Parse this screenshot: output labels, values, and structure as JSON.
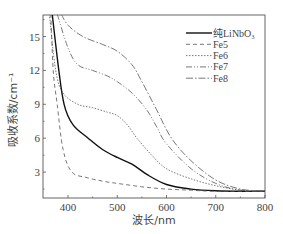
{
  "chart_data": {
    "type": "line",
    "title": "",
    "xlabel": "波长/nm",
    "ylabel": "吸收系数/cm⁻¹",
    "xlim": [
      350,
      805
    ],
    "ylim": [
      0.7,
      17
    ],
    "xticks": [
      400,
      500,
      600,
      700,
      800
    ],
    "yticks": [
      3,
      6,
      9,
      12,
      15
    ],
    "grid": false,
    "legend_position": "upper right",
    "series": [
      {
        "name": "纯LiNbO₃",
        "style": "solid",
        "x": [
          368,
          380,
          392,
          410,
          441,
          470,
          500,
          530,
          560,
          600,
          650,
          700,
          750,
          800
        ],
        "y": [
          17,
          12.5,
          9,
          7.2,
          6,
          5,
          4.3,
          3.7,
          2.8,
          1.9,
          1.5,
          1.35,
          1.3,
          1.3
        ]
      },
      {
        "name": "Fe5",
        "style": "dashed",
        "x": [
          365,
          370,
          378,
          390,
          408,
          440,
          470,
          500,
          550,
          600,
          650,
          700,
          800
        ],
        "y": [
          17,
          12,
          9,
          5,
          3,
          2.5,
          2.2,
          2.0,
          1.7,
          1.5,
          1.4,
          1.3,
          1.3
        ]
      },
      {
        "name": "Fe6",
        "style": "dotted",
        "x": [
          362,
          375,
          390,
          420,
          450,
          480,
          500,
          520,
          540,
          570,
          600,
          650,
          700,
          750,
          800
        ],
        "y": [
          17,
          12,
          10,
          9,
          8.7,
          8.3,
          8.0,
          7.2,
          6,
          4.5,
          3.3,
          2.4,
          1.8,
          1.4,
          1.3
        ]
      },
      {
        "name": "Fe7",
        "style": "dash-dot-dot",
        "x": [
          378,
          400,
          420,
          450,
          480,
          500,
          530,
          560,
          580,
          600,
          650,
          700,
          750,
          800
        ],
        "y": [
          17,
          14,
          12.5,
          12,
          11.5,
          11,
          10,
          8.5,
          7,
          5.5,
          3.3,
          2.0,
          1.4,
          1.3
        ]
      },
      {
        "name": "Fe8",
        "style": "dash-dot",
        "x": [
          386,
          400,
          430,
          470,
          500,
          530,
          550,
          580,
          610,
          650,
          700,
          750,
          800
        ],
        "y": [
          17,
          16,
          15,
          14.3,
          13.7,
          12.5,
          11,
          8.5,
          6,
          4,
          2.3,
          1.5,
          1.3
        ]
      }
    ]
  },
  "legend": {
    "items": [
      {
        "label": "纯LiNbO₃",
        "style": "solid"
      },
      {
        "label": "Fe5",
        "style": "dashed"
      },
      {
        "label": "Fe6",
        "style": "dotted"
      },
      {
        "label": "Fe7",
        "style": "dash-dot-dot"
      },
      {
        "label": "Fe8",
        "style": "dash-dot"
      }
    ]
  },
  "axes": {
    "xlabel": "波长/nm",
    "ylabel": "吸收系数/cm⁻¹",
    "xticks": [
      "400",
      "500",
      "600",
      "700",
      "800"
    ],
    "yticks": [
      "3",
      "6",
      "9",
      "12",
      "15"
    ]
  }
}
